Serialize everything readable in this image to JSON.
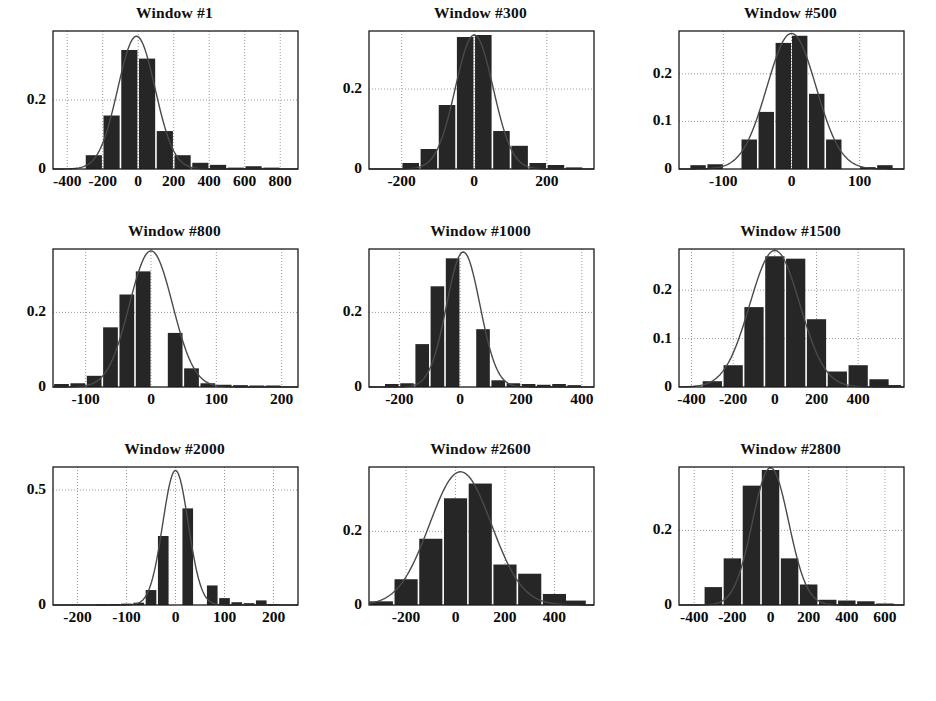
{
  "figure": {
    "kind": "histogram-grid",
    "rows": 3,
    "cols": 3,
    "background": "#ffffff",
    "bar_color": "#262626",
    "curve_color": "#4a4a4a",
    "axis_color": "#1a1a1a",
    "grid_color": "#9a9a9a"
  },
  "chart_data": [
    {
      "type": "bar",
      "title": "Window #1",
      "xlabel": "",
      "ylabel": "",
      "grid": true,
      "legend": null,
      "xlim": [
        -480,
        900
      ],
      "ylim": [
        0,
        0.4
      ],
      "xticks": [
        -400,
        -200,
        0,
        200,
        400,
        600,
        800
      ],
      "xticklabels": [
        "-400",
        "-200",
        "0",
        "200",
        "400",
        "600",
        "800"
      ],
      "yticks": [
        0,
        0.2
      ],
      "yticklabels": [
        "0",
        "0.2"
      ],
      "bin_width": 100,
      "bin_centers": [
        -350,
        -250,
        -150,
        -50,
        50,
        150,
        250,
        350,
        450,
        550,
        650,
        750
      ],
      "values": [
        0.0,
        0.04,
        0.155,
        0.345,
        0.32,
        0.11,
        0.04,
        0.018,
        0.012,
        0.004,
        0.008,
        0.004
      ],
      "curve": {
        "name": "fitted density",
        "mu": -10,
        "sigma": 105,
        "peak": 0.385
      }
    },
    {
      "type": "bar",
      "title": "Window #300",
      "xlabel": "",
      "ylabel": "",
      "grid": true,
      "legend": null,
      "xlim": [
        -290,
        330
      ],
      "ylim": [
        0,
        0.345
      ],
      "xticks": [
        -200,
        0,
        200
      ],
      "xticklabels": [
        "-200",
        "0",
        "200"
      ],
      "yticks": [
        0,
        0.2
      ],
      "yticklabels": [
        "0",
        "0.2"
      ],
      "bin_width": 50,
      "bin_centers": [
        -225,
        -175,
        -125,
        -75,
        -25,
        25,
        75,
        125,
        175,
        225,
        275
      ],
      "values": [
        0.0,
        0.015,
        0.05,
        0.16,
        0.33,
        0.335,
        0.095,
        0.058,
        0.015,
        0.01,
        0.004
      ],
      "curve": {
        "name": "fitted density",
        "mu": 0,
        "sigma": 52,
        "peak": 0.335
      }
    },
    {
      "type": "bar",
      "title": "Window #500",
      "xlabel": "",
      "ylabel": "",
      "grid": true,
      "legend": null,
      "xlim": [
        -165,
        165
      ],
      "ylim": [
        0,
        0.29
      ],
      "xticks": [
        -100,
        0,
        100
      ],
      "xticklabels": [
        "-100",
        "0",
        "100"
      ],
      "yticks": [
        0,
        0.1,
        0.2
      ],
      "yticklabels": [
        "0",
        "0.1",
        "0.2"
      ],
      "bin_width": 25,
      "bin_centers": [
        -137,
        -112,
        -87,
        -62,
        -37,
        -12,
        12,
        37,
        62,
        87,
        112,
        137
      ],
      "values": [
        0.008,
        0.01,
        0.0,
        0.062,
        0.12,
        0.265,
        0.28,
        0.158,
        0.062,
        0.0,
        0.004,
        0.008
      ],
      "curve": {
        "name": "fitted density",
        "mu": 0,
        "sigma": 36,
        "peak": 0.285
      }
    },
    {
      "type": "bar",
      "title": "Window #800",
      "xlabel": "",
      "ylabel": "",
      "grid": true,
      "legend": null,
      "xlim": [
        -150,
        225
      ],
      "ylim": [
        0,
        0.37
      ],
      "xticks": [
        -100,
        0,
        100,
        200
      ],
      "xticklabels": [
        "-100",
        "0",
        "100",
        "200"
      ],
      "yticks": [
        0,
        0.2
      ],
      "yticklabels": [
        "0",
        "0.2"
      ],
      "bin_width": 25,
      "bin_centers": [
        -137,
        -112,
        -87,
        -62,
        -37,
        -12,
        12,
        37,
        62,
        87,
        112,
        137,
        162,
        187,
        212
      ],
      "values": [
        0.008,
        0.01,
        0.03,
        0.16,
        0.248,
        0.31,
        0.0,
        0.145,
        0.05,
        0.01,
        0.006,
        0.005,
        0.004,
        0.004,
        0.0
      ],
      "curve": {
        "name": "fitted density",
        "mu": 0,
        "sigma": 33,
        "peak": 0.365
      }
    },
    {
      "type": "bar",
      "title": "Window #1000",
      "xlabel": "",
      "ylabel": "",
      "grid": true,
      "legend": null,
      "xlim": [
        -300,
        440
      ],
      "ylim": [
        0,
        0.37
      ],
      "xticks": [
        -200,
        0,
        200,
        400
      ],
      "xticklabels": [
        "-200",
        "0",
        "200",
        "400"
      ],
      "yticks": [
        0,
        0.2
      ],
      "yticklabels": [
        "0",
        "0.2"
      ],
      "bin_width": 50,
      "bin_centers": [
        -275,
        -225,
        -175,
        -125,
        -75,
        -25,
        25,
        75,
        125,
        175,
        225,
        275,
        325,
        375,
        425
      ],
      "values": [
        0.0,
        0.008,
        0.01,
        0.115,
        0.27,
        0.345,
        0.0,
        0.155,
        0.018,
        0.01,
        0.008,
        0.006,
        0.008,
        0.005,
        0.0
      ],
      "curve": {
        "name": "fitted density",
        "mu": 10,
        "sigma": 55,
        "peak": 0.362
      }
    },
    {
      "type": "bar",
      "title": "Window #1500",
      "xlabel": "",
      "ylabel": "",
      "grid": true,
      "legend": null,
      "xlim": [
        -460,
        620
      ],
      "ylim": [
        0,
        0.285
      ],
      "xticks": [
        -400,
        -200,
        0,
        200,
        400
      ],
      "xticklabels": [
        "-400",
        "-200",
        "0",
        "200",
        "400"
      ],
      "yticks": [
        0,
        0.1,
        0.2
      ],
      "yticklabels": [
        "0",
        "0.1",
        "0.2"
      ],
      "bin_width": 100,
      "bin_centers": [
        -400,
        -300,
        -200,
        -100,
        0,
        100,
        200,
        300,
        400,
        500,
        560
      ],
      "values": [
        0.0,
        0.012,
        0.045,
        0.165,
        0.27,
        0.265,
        0.14,
        0.032,
        0.045,
        0.016,
        0.004
      ],
      "curve": {
        "name": "fitted density",
        "mu": 0,
        "sigma": 120,
        "peak": 0.282
      }
    },
    {
      "type": "bar",
      "title": "Window #2000",
      "xlabel": "",
      "ylabel": "",
      "grid": true,
      "legend": null,
      "xlim": [
        -250,
        250
      ],
      "ylim": [
        0,
        0.6
      ],
      "xticks": [
        -200,
        -100,
        0,
        100,
        200
      ],
      "xticklabels": [
        "-200",
        "-100",
        "0",
        "100",
        "200"
      ],
      "yticks": [
        0,
        0.5
      ],
      "yticklabels": [
        "0",
        "0.5"
      ],
      "bin_width": 25,
      "bin_centers": [
        -225,
        -200,
        -175,
        -150,
        -125,
        -100,
        -75,
        -50,
        -25,
        0,
        25,
        50,
        75,
        100,
        125,
        150,
        175,
        200,
        225
      ],
      "values": [
        0.0,
        0.0,
        0.0,
        0.002,
        0.004,
        0.006,
        0.01,
        0.065,
        0.3,
        0.0,
        0.42,
        0.0,
        0.085,
        0.03,
        0.012,
        0.008,
        0.02,
        0.004,
        0.0
      ],
      "curve": {
        "name": "fitted density",
        "mu": 0,
        "sigma": 26,
        "peak": 0.585
      }
    },
    {
      "type": "bar",
      "title": "Window #2600",
      "xlabel": "",
      "ylabel": "",
      "grid": true,
      "legend": null,
      "xlim": [
        -350,
        560
      ],
      "ylim": [
        0,
        0.375
      ],
      "xticks": [
        -200,
        0,
        200,
        400
      ],
      "xticklabels": [
        "-200",
        "0",
        "200",
        "400"
      ],
      "yticks": [
        0,
        0.2
      ],
      "yticklabels": [
        "0",
        "0.2"
      ],
      "bin_width": 100,
      "bin_centers": [
        -300,
        -200,
        -100,
        0,
        100,
        200,
        300,
        400,
        480
      ],
      "values": [
        0.01,
        0.07,
        0.18,
        0.29,
        0.33,
        0.11,
        0.085,
        0.03,
        0.012
      ],
      "curve": {
        "name": "fitted density",
        "mu": 20,
        "sigma": 125,
        "peak": 0.362
      }
    },
    {
      "type": "bar",
      "title": "Window #2800",
      "xlabel": "",
      "ylabel": "",
      "grid": true,
      "legend": null,
      "xlim": [
        -480,
        700
      ],
      "ylim": [
        0,
        0.37
      ],
      "xticks": [
        -400,
        -200,
        0,
        200,
        400,
        600
      ],
      "xticklabels": [
        "-400",
        "-200",
        "0",
        "200",
        "400",
        "600"
      ],
      "yticks": [
        0,
        0.2
      ],
      "yticklabels": [
        "0",
        "0.2"
      ],
      "bin_width": 100,
      "bin_centers": [
        -400,
        -300,
        -200,
        -100,
        0,
        100,
        200,
        300,
        400,
        500,
        600
      ],
      "values": [
        0.0,
        0.048,
        0.125,
        0.32,
        0.362,
        0.125,
        0.055,
        0.014,
        0.012,
        0.01,
        0.004
      ],
      "curve": {
        "name": "fitted density",
        "mu": 0,
        "sigma": 95,
        "peak": 0.368
      }
    }
  ],
  "panel_geometry": [
    {
      "left": 52,
      "top": 30,
      "box_w": 245,
      "box_h": 138,
      "title_y": 0
    },
    {
      "left": 368,
      "top": 30,
      "box_w": 225,
      "box_h": 138,
      "title_y": 0
    },
    {
      "left": 678,
      "top": 30,
      "box_w": 225,
      "box_h": 138,
      "title_y": 0
    },
    {
      "left": 52,
      "top": 248,
      "box_w": 245,
      "box_h": 138,
      "title_y": 0
    },
    {
      "left": 368,
      "top": 248,
      "box_w": 225,
      "box_h": 138,
      "title_y": 0
    },
    {
      "left": 678,
      "top": 248,
      "box_w": 225,
      "box_h": 138,
      "title_y": 0
    },
    {
      "left": 52,
      "top": 466,
      "box_w": 245,
      "box_h": 138,
      "title_y": 0
    },
    {
      "left": 368,
      "top": 466,
      "box_w": 225,
      "box_h": 138,
      "title_y": 0
    },
    {
      "left": 678,
      "top": 466,
      "box_w": 225,
      "box_h": 138,
      "title_y": 0
    }
  ]
}
